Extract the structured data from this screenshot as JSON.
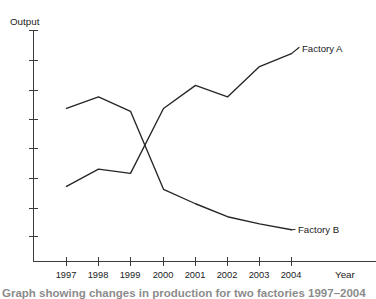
{
  "chart_data": {
    "type": "line",
    "title": "",
    "xlabel": "Year",
    "ylabel": "Output",
    "categories": [
      "1997",
      "1998",
      "1999",
      "2000",
      "2001",
      "2002",
      "2003",
      "2004"
    ],
    "x": [
      1997,
      1998,
      1999,
      2000,
      2001,
      2002,
      2003,
      2004
    ],
    "series": [
      {
        "name": "Factory A",
        "label": "Factory A",
        "values": [
          2.6,
          3.2,
          3.05,
          5.3,
          6.1,
          5.7,
          6.75,
          7.2
        ]
      },
      {
        "name": "Factory B",
        "label": "Factory B",
        "values": [
          5.3,
          5.7,
          5.2,
          2.5,
          2.0,
          1.55,
          1.3,
          1.1
        ]
      }
    ],
    "ylim": [
      0,
      8
    ],
    "yticks": [
      1,
      2,
      3,
      4,
      5,
      6,
      7,
      8
    ],
    "ytick_labels": [
      "",
      "",
      "",
      "",
      "",
      "",
      "",
      ""
    ],
    "xlim": [
      1996.0,
      2005.3
    ],
    "grid": false,
    "legend": "inline-end-labels",
    "legend_position": "right",
    "line_color": "#262626",
    "axis_color": "#3b3b3b",
    "background_color": "#ffffff"
  },
  "axes": {
    "y_axis_title": "Output",
    "x_axis_title": "Year"
  },
  "caption": {
    "text": "Graph showing changes in production for two factories 1997–2004"
  }
}
